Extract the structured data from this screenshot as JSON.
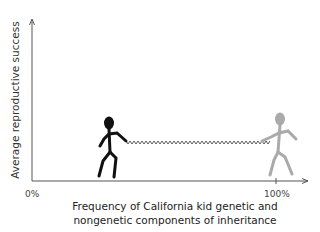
{
  "diagram": {
    "y_axis_label": "Average reproductive success",
    "x_axis_label_line1": "Frequency of California kid genetic and",
    "x_axis_label_line2": "nongenetic components of inheritance",
    "tick_left": "0%",
    "tick_right": "100%",
    "figures": [
      {
        "name": "black stick figure",
        "color": "#111111",
        "position": "left"
      },
      {
        "name": "gray stick figure",
        "color": "#a8a8a8",
        "position": "right at 100%"
      }
    ],
    "connector": "wavy spring between the two figures' hands"
  }
}
